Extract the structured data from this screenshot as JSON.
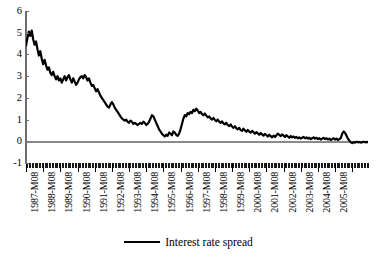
{
  "chart_data": {
    "type": "line",
    "title": "",
    "subtitle": "",
    "xlabel": "",
    "ylabel": "",
    "grid": false,
    "legend_position": "bottom-center",
    "ylim": [
      -1,
      6
    ],
    "y_ticks": [
      "6",
      "5",
      "4",
      "3",
      "2",
      "1",
      "0",
      "-1"
    ],
    "y_tick_values": [
      6,
      5,
      4,
      3,
      2,
      1,
      0,
      -1
    ],
    "x_tick_labels": [
      "1987-M08",
      "1988-M08",
      "1989-M08",
      "1990-M08",
      "1991-M08",
      "1992-M08",
      "1993-M08",
      "1994-M08",
      "1995-M08",
      "1996-M08",
      "1997-M08",
      "1998-M08",
      "1999-M08",
      "2000-M08",
      "2001-M08",
      "2002-M08",
      "2003-M08",
      "2004-M08",
      "2005-M08"
    ],
    "x_minor_tick_interval": "month",
    "x_major_tick_interval": "year",
    "series": [
      {
        "name": "Interest rate spread",
        "color": "#000000",
        "line_width": 2.2,
        "x_start": "1987-M08",
        "x_end": "2005-M12",
        "values": [
          4.4,
          4.75,
          5.05,
          4.85,
          5.1,
          4.7,
          4.45,
          4.6,
          4.25,
          3.95,
          4.15,
          3.8,
          3.55,
          3.75,
          3.5,
          3.3,
          3.4,
          3.15,
          3.05,
          3.2,
          3.0,
          2.85,
          3.0,
          2.8,
          2.9,
          2.7,
          2.85,
          3.0,
          2.8,
          2.95,
          3.05,
          2.85,
          2.7,
          2.9,
          2.75,
          2.6,
          2.7,
          2.85,
          2.95,
          3.0,
          2.9,
          3.05,
          2.95,
          2.8,
          2.9,
          2.7,
          2.55,
          2.6,
          2.45,
          2.3,
          2.4,
          2.25,
          2.1,
          2.0,
          1.9,
          1.8,
          1.7,
          1.6,
          1.55,
          1.7,
          1.8,
          1.7,
          1.55,
          1.45,
          1.35,
          1.25,
          1.15,
          1.05,
          1.0,
          0.95,
          1.0,
          0.9,
          0.85,
          0.95,
          0.9,
          0.8,
          0.85,
          0.8,
          0.75,
          0.8,
          0.85,
          0.8,
          0.9,
          0.85,
          0.75,
          0.8,
          0.9,
          1.05,
          1.2,
          1.15,
          1.0,
          0.85,
          0.7,
          0.55,
          0.45,
          0.35,
          0.28,
          0.22,
          0.3,
          0.25,
          0.4,
          0.35,
          0.28,
          0.45,
          0.4,
          0.3,
          0.25,
          0.35,
          0.55,
          0.8,
          1.05,
          1.2,
          1.15,
          1.3,
          1.25,
          1.35,
          1.3,
          1.45,
          1.38,
          1.5,
          1.42,
          1.3,
          1.35,
          1.25,
          1.2,
          1.28,
          1.18,
          1.1,
          1.15,
          1.05,
          1.0,
          1.08,
          0.98,
          0.92,
          1.0,
          0.9,
          0.85,
          0.92,
          0.82,
          0.78,
          0.85,
          0.75,
          0.7,
          0.78,
          0.68,
          0.62,
          0.7,
          0.6,
          0.55,
          0.62,
          0.52,
          0.48,
          0.58,
          0.5,
          0.44,
          0.52,
          0.45,
          0.4,
          0.48,
          0.42,
          0.35,
          0.42,
          0.36,
          0.3,
          0.38,
          0.32,
          0.26,
          0.34,
          0.28,
          0.22,
          0.3,
          0.24,
          0.18,
          0.26,
          0.2,
          0.28,
          0.35,
          0.3,
          0.24,
          0.32,
          0.26,
          0.2,
          0.28,
          0.22,
          0.16,
          0.24,
          0.18,
          0.22,
          0.16,
          0.2,
          0.14,
          0.18,
          0.12,
          0.16,
          0.2,
          0.14,
          0.18,
          0.12,
          0.16,
          0.1,
          0.14,
          0.18,
          0.12,
          0.16,
          0.1,
          0.14,
          0.08,
          0.12,
          0.16,
          0.1,
          0.14,
          0.08,
          0.12,
          0.06,
          0.1,
          0.14,
          0.08,
          0.12,
          0.06,
          0.1,
          0.15,
          0.35,
          0.45,
          0.38,
          0.25,
          0.12,
          0.02,
          -0.05,
          -0.08,
          -0.04,
          -0.06,
          -0.02,
          -0.05,
          -0.03,
          -0.06,
          -0.04,
          -0.02,
          -0.05,
          -0.03,
          -0.04
        ]
      }
    ]
  },
  "legend": {
    "entries": [
      {
        "label": "Interest rate spread",
        "color": "#000000"
      }
    ]
  },
  "colors": {
    "series": "#000000",
    "axis": "#6e6e6e",
    "zero_line": "#8a8a8a",
    "background": "#ffffff",
    "text": "#000000"
  }
}
